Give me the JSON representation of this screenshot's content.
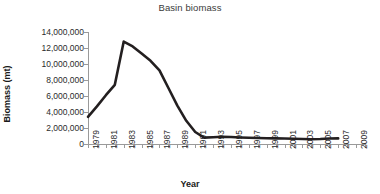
{
  "chart_data": {
    "type": "line",
    "title": "Basin biomass",
    "xlabel": "Year",
    "ylabel": "Biomass (mt)",
    "grid": false,
    "legend": "none",
    "line_color": "#231f20",
    "x": [
      1979,
      1980,
      1981,
      1982,
      1983,
      1984,
      1985,
      1986,
      1987,
      1988,
      1989,
      1990,
      1991,
      1992,
      1993,
      1994,
      1995,
      1996,
      1997,
      1998,
      1999,
      2000,
      2001,
      2002,
      2003,
      2004,
      2005,
      2006,
      2007
    ],
    "values": [
      3400000,
      4700000,
      6100000,
      7400000,
      12800000,
      12200000,
      11300000,
      10400000,
      9200000,
      7000000,
      4800000,
      2900000,
      1500000,
      800000,
      850000,
      900000,
      880000,
      820000,
      780000,
      750000,
      720000,
      700000,
      680000,
      650000,
      620000,
      600000,
      620000,
      680000,
      700000
    ],
    "xlim": [
      1979,
      2010
    ],
    "ylim": [
      0,
      14000000
    ],
    "ytick_values": [
      0,
      2000000,
      4000000,
      6000000,
      8000000,
      10000000,
      12000000,
      14000000
    ],
    "ytick_labels": [
      "0",
      "2,000,000",
      "4,000,000",
      "6,000,000",
      "8,000,000",
      "10,000,000",
      "12,000,000",
      "14,000,000"
    ],
    "xtick_values": [
      1979,
      1980,
      1981,
      1982,
      1983,
      1984,
      1985,
      1986,
      1987,
      1988,
      1989,
      1990,
      1991,
      1992,
      1993,
      1994,
      1995,
      1996,
      1997,
      1998,
      1999,
      2000,
      2001,
      2002,
      2003,
      2004,
      2005,
      2006,
      2007,
      2008,
      2009,
      2010
    ],
    "xtick_labels_shown": [
      "1979",
      "1981",
      "1983",
      "1985",
      "1987",
      "1989",
      "1991",
      "1993",
      "1995",
      "1997",
      "1999",
      "2001",
      "2003",
      "2005",
      "2007",
      "2009"
    ]
  }
}
